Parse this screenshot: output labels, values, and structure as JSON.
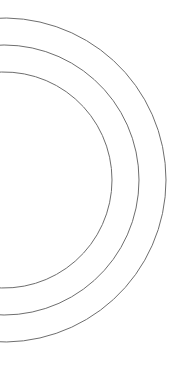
{
  "canvas": {
    "width": 182,
    "height": 369,
    "background": "#ffffff"
  },
  "arcs": {
    "stroke": "#6e6e6e",
    "stroke_width": 1,
    "center": {
      "x": 4,
      "y": 180
    },
    "items": [
      {
        "name": "inner",
        "radius": 108
      },
      {
        "name": "middle",
        "radius": 135
      },
      {
        "name": "outer",
        "radius": 162
      }
    ]
  }
}
